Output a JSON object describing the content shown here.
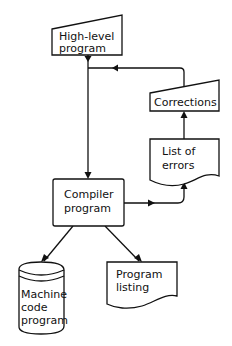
{
  "diagram": {
    "type": "flowchart",
    "nodes": {
      "high_level": {
        "line1": "High-level",
        "line2": "program",
        "shape": "manual-input"
      },
      "corrections": {
        "line1": "Corrections",
        "shape": "manual-input"
      },
      "errors": {
        "line1": "List of",
        "line2": "errors",
        "shape": "document"
      },
      "compiler": {
        "line1": "Compiler",
        "line2": "program",
        "shape": "process"
      },
      "machine_code": {
        "line1": "Machine",
        "line2": "code",
        "line3": "program",
        "shape": "stored-data"
      },
      "listing": {
        "line1": "Program",
        "line2": "listing",
        "shape": "document"
      }
    },
    "edges": [
      {
        "from": "High-level program",
        "to": "Compiler program"
      },
      {
        "from": "Compiler program",
        "to": "List of errors"
      },
      {
        "from": "List of errors",
        "to": "Corrections"
      },
      {
        "from": "Corrections",
        "to": "Compiler program"
      },
      {
        "from": "Compiler program",
        "to": "Machine code program"
      },
      {
        "from": "Compiler program",
        "to": "Program listing"
      }
    ],
    "colors": {
      "stroke": "#111111",
      "background": "#ffffff"
    }
  }
}
